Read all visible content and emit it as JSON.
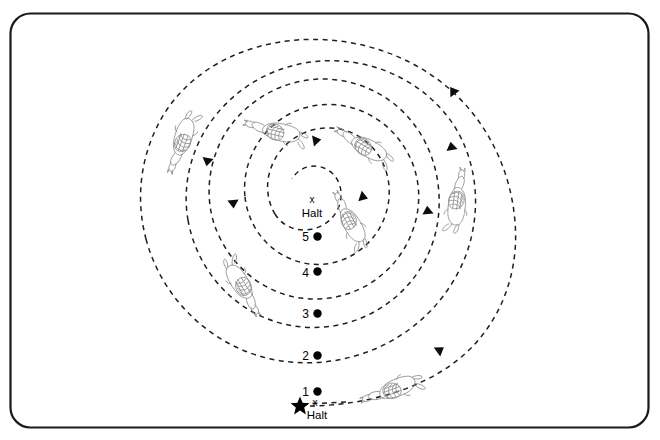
{
  "diagram": {
    "background_color": "#ffffff",
    "border_color": "#1a1a1a",
    "path_color": "#1f1f1f",
    "arrow_color": "#0d0d0d",
    "figure_color": "#8d8d8d"
  },
  "center": {
    "x_mark": "x",
    "halt_label": "Halt"
  },
  "start": {
    "x_mark": "x",
    "halt_label": "Halt",
    "star_glyph": "star"
  },
  "loop_markers": [
    {
      "label": "1",
      "cy": 392
    },
    {
      "label": "2",
      "cy": 355
    },
    {
      "label": "3",
      "cy": 313
    },
    {
      "label": "4",
      "cy": 272
    },
    {
      "label": "5",
      "cy": 236
    }
  ],
  "horses": [
    {
      "name": "horse-outer-left",
      "x": 183,
      "y": 136,
      "rot": -52
    },
    {
      "name": "horse-outer-right",
      "x": 457,
      "y": 203,
      "rot": 98
    },
    {
      "name": "horse-mid-left",
      "x": 240,
      "y": 281,
      "rot": -122
    },
    {
      "name": "horse-mid-top",
      "x": 277,
      "y": 131,
      "rot": -15
    },
    {
      "name": "horse-inner-top",
      "x": 365,
      "y": 147,
      "rot": 32
    },
    {
      "name": "horse-inner-right",
      "x": 352,
      "y": 225,
      "rot": 70
    },
    {
      "name": "horse-bottom",
      "x": 395,
      "y": 387,
      "rot": 145
    }
  ],
  "arrows": [
    {
      "name": "arrow-outer-right-upper",
      "x": 455,
      "y": 94,
      "rot": -35
    },
    {
      "name": "arrow-outer-left-lower",
      "x": 208,
      "y": 158,
      "rot": 150
    },
    {
      "name": "arrow-mid-right",
      "x": 452,
      "y": 148,
      "rot": -20
    },
    {
      "name": "arrow-mid-left",
      "x": 233,
      "y": 202,
      "rot": 172
    },
    {
      "name": "arrow-inner-right",
      "x": 428,
      "y": 214,
      "rot": -5
    },
    {
      "name": "arrow-top-center",
      "x": 313,
      "y": 141,
      "rot": 72
    },
    {
      "name": "arrow-center-small",
      "x": 359,
      "y": 196,
      "rot": 118
    },
    {
      "name": "arrow-bottom-right",
      "x": 437,
      "y": 352,
      "rot": 55
    }
  ]
}
